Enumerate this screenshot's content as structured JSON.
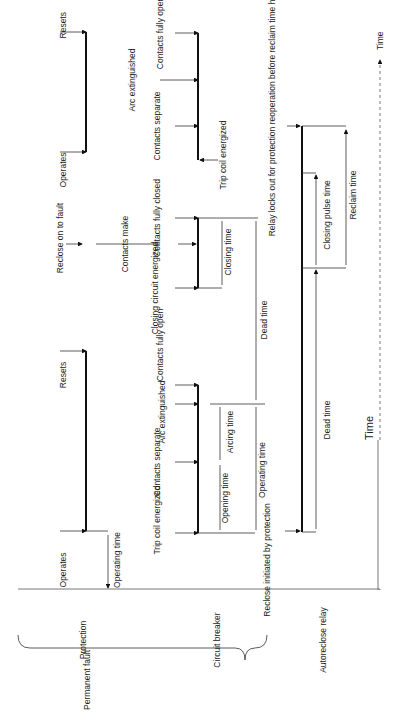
{
  "axis": {
    "time_label": "Time",
    "time_arrow_label": "Time"
  },
  "groups": {
    "permanent_fault": "Permanent fault",
    "protection": "Protection",
    "circuit_breaker": "Circuit breaker",
    "autoreclose_relay": "Autoreclose relay"
  },
  "protection": {
    "operates_1": "Operates",
    "resets_1": "Resets",
    "operating_time": "Operating time",
    "reclose_on_to_fault": "Reclose on to fault",
    "operates_2": "Operates",
    "resets_2": "Resets"
  },
  "circuit_breaker": {
    "trip_coil_energized_1": "Trip coil energized",
    "contacts_separate_1": "Contacts separate",
    "arc_extinguished_1": "Arc extinguished",
    "contacts_fully_open_1": "Contacts fully open",
    "opening_time": "Opening time",
    "arcing_time": "Arcing time",
    "operating_time": "Operating time",
    "closing_circuit_energized": "Closing circuit energized",
    "contacts_make": "Contacts make",
    "contacts_fully_closed": "Contacts fully closed",
    "closing_time": "Closing time",
    "dead_time": "Dead time",
    "contacts_separate_2": "Contacts separate",
    "arc_extinguished_2": "Arc extinguished",
    "contacts_fully_open_2": "Contacts fully open",
    "trip_coil_energized_2": "Trip coil energized"
  },
  "autoreclose_relay": {
    "reclose_initiated": "Reclose initiated by protection",
    "dead_time": "Dead time",
    "closing_pulse_time": "Closing pulse time",
    "reclaim_time": "Reclaim time",
    "lockout_note": "Relay locks out for protection reoperation before reclaim time has closed"
  }
}
